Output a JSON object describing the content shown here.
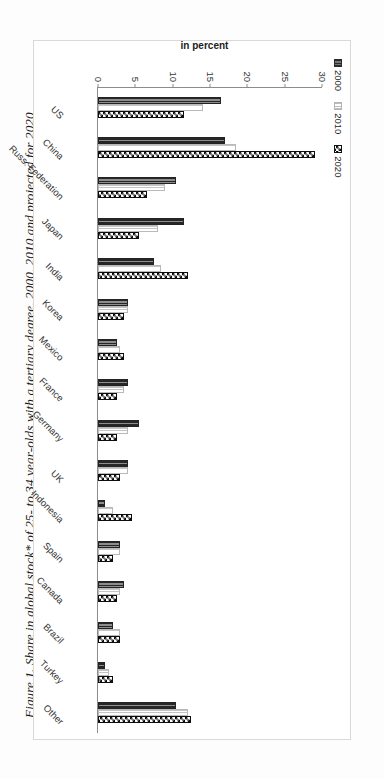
{
  "figure": {
    "title": "Figure 1. Share in global stock* of 25- to 34 year-olds with a tertiary degree, 2000, 2010 and projected for 2020"
  },
  "chart_data": {
    "type": "bar",
    "orientation": "horizontal-rotated",
    "title": "Figure 1. Share in global stock* of 25- to 34 year-olds with a tertiary degree, 2000, 2010 and projected for 2020",
    "xlabel": "",
    "ylabel": "in percent",
    "ylim": [
      0,
      30
    ],
    "yticks": [
      "0",
      "5",
      "10",
      "15",
      "20",
      "25",
      "30"
    ],
    "ytick_values": [
      0,
      5,
      10,
      15,
      20,
      25,
      30
    ],
    "grid": false,
    "legend_position": "top-left",
    "categories": [
      "US",
      "China",
      "Russ. Federation",
      "Japan",
      "India",
      "Korea",
      "Mexico",
      "France",
      "Germany",
      "UK",
      "Indonesia",
      "Spain",
      "Canada",
      "Brazil",
      "Turkey",
      "Other"
    ],
    "series": [
      {
        "name": "2000",
        "color": "#2b2b2b",
        "pattern": "dense-vertical-hatch",
        "values": [
          16.5,
          17.0,
          10.5,
          11.5,
          7.5,
          4.0,
          2.5,
          4.0,
          5.5,
          4.0,
          1.0,
          3.0,
          3.5,
          2.0,
          1.0,
          10.5
        ]
      },
      {
        "name": "2010",
        "color": "#bdbdbd",
        "pattern": "light-dotted",
        "values": [
          14.0,
          18.5,
          9.0,
          8.0,
          8.5,
          4.0,
          3.0,
          3.5,
          4.0,
          4.0,
          2.0,
          3.0,
          3.0,
          3.0,
          1.5,
          12.0
        ]
      },
      {
        "name": "2020",
        "color": "#0d0d0d",
        "pattern": "checkerboard",
        "values": [
          11.5,
          29.0,
          6.5,
          5.5,
          12.0,
          3.5,
          3.5,
          2.5,
          2.5,
          3.0,
          4.5,
          2.0,
          2.5,
          3.0,
          2.0,
          12.5
        ]
      }
    ]
  },
  "legend": {
    "items": [
      {
        "label": "2000",
        "swatch": "series-2000-swatch"
      },
      {
        "label": "2010",
        "swatch": "series-2010-swatch"
      },
      {
        "label": "2020",
        "swatch": "series-2020-swatch"
      }
    ]
  }
}
